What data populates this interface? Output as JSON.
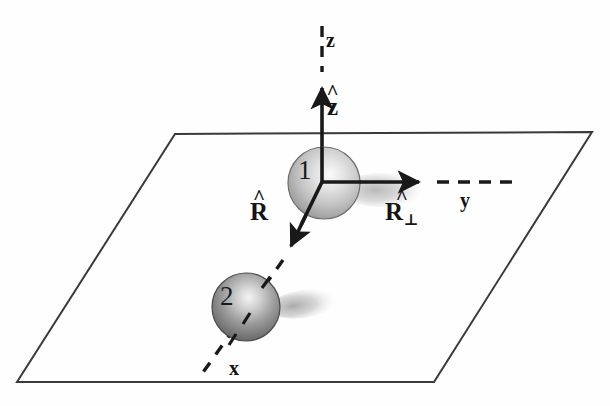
{
  "figure": {
    "background_color": "#fefefe",
    "ink_color": "#262626",
    "plane": {
      "name": "xy-plane",
      "corners": [
        [
          175,
          134
        ],
        [
          592,
          132
        ],
        [
          434,
          382
        ],
        [
          17,
          382
        ]
      ],
      "stroke_color": "#3a3a3a",
      "stroke_width": 2.0,
      "filled": false
    },
    "axes": [
      {
        "id": "z",
        "label": "z",
        "label_pos": [
          333,
          40
        ],
        "unit_label": "z",
        "unit_hat": true,
        "unit_label_pos": [
          337,
          107
        ],
        "solid_from": [
          322,
          182
        ],
        "solid_to": [
          322,
          86
        ],
        "arrow_tip": [
          322,
          78
        ],
        "dashed_from": [
          322,
          72
        ],
        "dashed_to": [
          322,
          26
        ],
        "direction": "up"
      },
      {
        "id": "y",
        "label": "y",
        "label_pos": [
          466,
          201
        ],
        "unit_label": "R",
        "unit_hat": true,
        "unit_subscript": "⊥",
        "unit_label_pos": [
          400,
          213
        ],
        "solid_from": [
          322,
          182
        ],
        "solid_to": [
          417,
          182
        ],
        "arrow_tip": [
          427,
          182
        ],
        "dashed_from": [
          436,
          182
        ],
        "dashed_to": [
          512,
          182
        ],
        "direction": "right"
      },
      {
        "id": "x",
        "label": "x",
        "label_pos": [
          235,
          369
        ],
        "unit_label": "R",
        "unit_hat": true,
        "unit_label_pos": [
          263,
          213
        ],
        "solid_from": [
          322,
          182
        ],
        "solid_to": [
          295,
          240
        ],
        "arrow_tip": [
          286,
          252
        ],
        "dashed_from": [
          282,
          258
        ],
        "dashed_to": [
          199,
          377
        ],
        "direction": "down-left"
      }
    ],
    "origin": [
      322,
      182
    ],
    "spheres": [
      {
        "label": "1",
        "label_pos": [
          305,
          170
        ],
        "center": [
          324,
          183
        ],
        "radius": 36,
        "fill_light": "#f2f2f2",
        "fill_dark": "#8d8d8d",
        "edge_color": "#6e6e6e",
        "shadow": {
          "cx": 382,
          "cy": 190,
          "rx": 40,
          "ry": 17,
          "color": "#cfcfcf"
        }
      },
      {
        "label": "2",
        "label_pos": [
          227,
          296
        ],
        "center": [
          246,
          307
        ],
        "radius": 34,
        "fill_light": "#ededed",
        "fill_dark": "#5e5e5e",
        "edge_color": "#4a4a4a",
        "shadow": {
          "cx": 303,
          "cy": 304,
          "rx": 33,
          "ry": 14,
          "color": "#bdbdbd"
        }
      }
    ]
  }
}
